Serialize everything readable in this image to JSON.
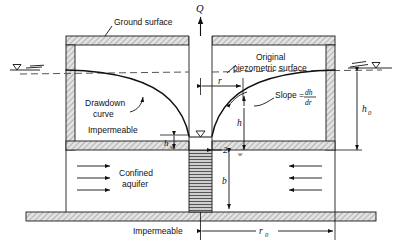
{
  "figure": {
    "type": "hydrogeology-cross-section",
    "labels": {
      "ground_surface": "Ground surface",
      "drawdown_curve_line1": "Drawdown",
      "drawdown_curve_line2": "curve",
      "original_piezo_line1": "Original",
      "original_piezo_line2": "piezometric surface",
      "impermeable_upper": "Impermeable",
      "impermeable_lower": "Impermeable",
      "confined_aquifer_line1": "Confined",
      "confined_aquifer_line2": "aquifer",
      "slope_text": "Slope =",
      "slope_num": "dh",
      "slope_den": "dr",
      "discharge": "Q",
      "radius_r": "r",
      "well_diameter": "2r",
      "well_diameter_sub": "w",
      "head_h": "h",
      "head_hw": "h",
      "head_hw_sub": "w",
      "head_h0": "h",
      "head_h0_sub": "0",
      "aquifer_thickness": "b",
      "radius_influence": "r",
      "radius_influence_sub": "0"
    },
    "colors": {
      "line": "#111111",
      "hatch_fill": "#d8d8d8",
      "background": "#ffffff",
      "screen_fill": "#bdbdbd"
    }
  }
}
